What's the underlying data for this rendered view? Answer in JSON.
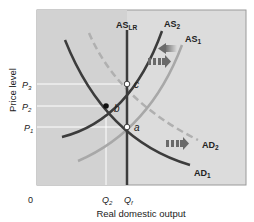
{
  "diagram": {
    "title": "",
    "y_axis_label": "Price level",
    "x_axis_label": "Real domestic output",
    "origin_label": "0",
    "price_levels": [
      {
        "sub": "3",
        "base": "P",
        "y": 84
      },
      {
        "sub": "2",
        "base": "P",
        "y": 106
      },
      {
        "sub": "1",
        "base": "P",
        "y": 127
      }
    ],
    "quantities": [
      {
        "base": "Q",
        "sub": "2",
        "x": 106
      },
      {
        "base": "Q",
        "sub": "f",
        "x": 127
      }
    ],
    "curves": {
      "as_lr": {
        "base": "AS",
        "sub": "LR"
      },
      "as2": {
        "base": "AS",
        "sub": "2"
      },
      "as1": {
        "base": "AS",
        "sub": "1"
      },
      "ad2": {
        "base": "AD",
        "sub": "2"
      },
      "ad1": {
        "base": "AD",
        "sub": "1"
      }
    },
    "points": [
      {
        "label": "c",
        "x": 127,
        "y": 84,
        "style": "open"
      },
      {
        "label": "b",
        "x": 106,
        "y": 106,
        "style": "filled"
      },
      {
        "label": "a",
        "x": 127,
        "y": 127,
        "style": "open"
      }
    ],
    "arrows": [
      {
        "name": "as-shift-left-arrow",
        "direction": "left"
      },
      {
        "name": "ad-shift-right-arrow-upper",
        "direction": "right"
      },
      {
        "name": "ad-shift-right-arrow-lower",
        "direction": "right"
      }
    ],
    "colors": {
      "plot_background": "#dcdcdc",
      "as2_curve": "#3c3c3c",
      "as1_curve": "#a8a8a8",
      "ad1_curve": "#3c3c3c",
      "ad2_curve": "#b0b0b0",
      "as_lr_line": "#3c3c3c",
      "arrow": "#6a6a6a"
    }
  }
}
